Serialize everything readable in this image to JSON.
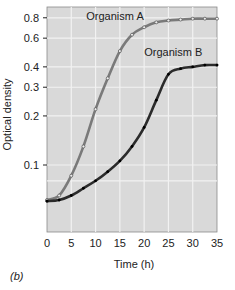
{
  "chart_data": {
    "type": "line",
    "title": "",
    "xlabel": "Time (h)",
    "ylabel": "Optical density",
    "xlim": [
      0,
      35
    ],
    "ylim": [
      0.055,
      0.85
    ],
    "yscale": "log",
    "grid": true,
    "x_ticks": [
      0,
      5,
      10,
      15,
      20,
      25,
      30,
      35
    ],
    "x_tick_labels": [
      "0",
      "5",
      "10",
      "15",
      "20",
      "25",
      "30",
      "35"
    ],
    "y_ticks": [
      0.1,
      0.2,
      0.3,
      0.4,
      0.6,
      0.8
    ],
    "y_tick_labels": [
      "0.1",
      "0.2",
      "0.3",
      "0.4",
      "0.6",
      "0.8"
    ],
    "y_grid": [
      0.08,
      0.1,
      0.2,
      0.3,
      0.4,
      0.6,
      0.8
    ],
    "x": [
      0,
      2.5,
      5,
      7.5,
      10,
      12.5,
      15,
      17.5,
      20,
      22.5,
      25,
      27.5,
      30,
      32.5,
      35
    ],
    "series": [
      {
        "name": "Organism A",
        "color": "#7a7a7a",
        "marker": "open-circle",
        "values": [
          0.061,
          0.065,
          0.086,
          0.13,
          0.22,
          0.34,
          0.5,
          0.63,
          0.7,
          0.75,
          0.77,
          0.78,
          0.79,
          0.79,
          0.79
        ]
      },
      {
        "name": "Organism B",
        "color": "#2b2b2b",
        "marker": "filled-circle",
        "values": [
          0.06,
          0.061,
          0.065,
          0.072,
          0.08,
          0.091,
          0.106,
          0.13,
          0.17,
          0.25,
          0.36,
          0.39,
          0.4,
          0.41,
          0.41
        ]
      }
    ],
    "annotations": [
      {
        "text": "Organism A",
        "x": 14,
        "y": 0.8
      },
      {
        "text": "Organism B",
        "x": 26,
        "y": 0.48
      }
    ],
    "legend": "none (inline labels)",
    "background": "#d9d9d9",
    "grid_color": "#f2f2f2"
  },
  "panel_label": "(b)"
}
